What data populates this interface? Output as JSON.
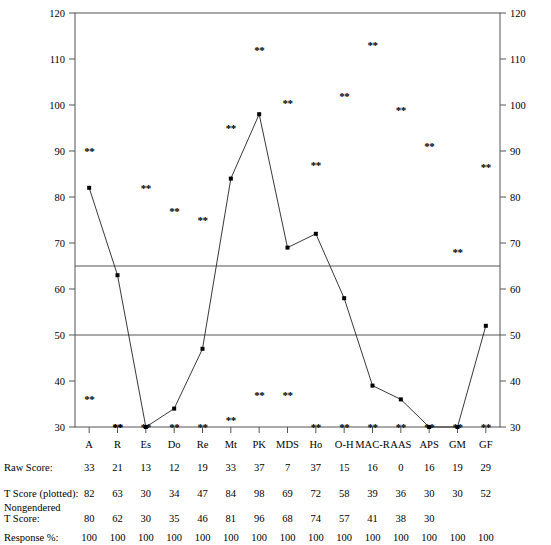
{
  "chart_data": {
    "type": "line",
    "title": "",
    "xlabel": "",
    "ylabel": "",
    "ylim": [
      30,
      120
    ],
    "yticks": [
      30,
      40,
      50,
      60,
      70,
      80,
      90,
      100,
      110,
      120
    ],
    "grid": false,
    "legend": "none",
    "reference_lines": [
      65,
      50
    ],
    "categories": [
      "A",
      "R",
      "Es",
      "Do",
      "Re",
      "Mt",
      "PK",
      "MDS",
      "Ho",
      "O-H",
      "MAC-R",
      "AAS",
      "APS",
      "GM",
      "GF"
    ],
    "series": [
      {
        "name": "T Score (plotted)",
        "values": [
          82,
          63,
          30,
          34,
          47,
          84,
          98,
          69,
          72,
          58,
          39,
          36,
          30,
          30,
          52
        ]
      }
    ],
    "secondary_markers": {
      "name": "asterisk-markers",
      "glyph": "**",
      "values": [
        90,
        30,
        82,
        77,
        75,
        95,
        112,
        100.5,
        87,
        102,
        113,
        99,
        91,
        68,
        86.5
      ]
    },
    "lower_markers": {
      "name": "lower-asterisk-markers",
      "glyph": "**",
      "values": [
        36,
        30,
        30,
        30,
        30,
        31.5,
        37,
        37,
        30,
        30,
        30,
        30,
        30,
        30,
        30
      ]
    }
  },
  "axis": {
    "left_ticks": [
      "120",
      "110",
      "100",
      "90",
      "80",
      "70",
      "60",
      "50",
      "40",
      "30"
    ],
    "right_ticks": [
      "120",
      "110",
      "100",
      "90",
      "80",
      "70",
      "60",
      "50",
      "40",
      "30"
    ]
  },
  "table": {
    "rows": [
      {
        "label": "Raw Score:",
        "values": [
          "33",
          "21",
          "13",
          "12",
          "19",
          "33",
          "37",
          "7",
          "37",
          "15",
          "16",
          "0",
          "16",
          "19",
          "29"
        ]
      },
      {
        "label": "T Score (plotted):",
        "values": [
          "82",
          "63",
          "30",
          "34",
          "47",
          "84",
          "98",
          "69",
          "72",
          "58",
          "39",
          "36",
          "30",
          "30",
          "52"
        ]
      },
      {
        "label": "Nongendered\nT Score:",
        "label_line1": "Nongendered",
        "label_line2": "T Score:",
        "values": [
          "80",
          "62",
          "30",
          "35",
          "46",
          "81",
          "96",
          "68",
          "74",
          "57",
          "41",
          "38",
          "30",
          "",
          ""
        ]
      },
      {
        "label": "Response %:",
        "values": [
          "100",
          "100",
          "100",
          "100",
          "100",
          "100",
          "100",
          "100",
          "100",
          "100",
          "100",
          "100",
          "100",
          "100",
          "100"
        ]
      }
    ]
  },
  "colors": {
    "line": "#222222",
    "frame": "#555555",
    "text": "#000000",
    "background": "#ffffff"
  }
}
